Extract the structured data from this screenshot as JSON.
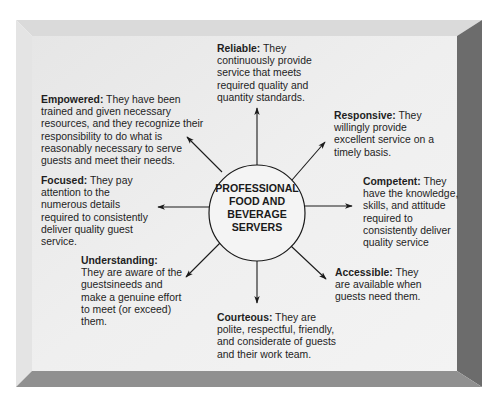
{
  "diagram": {
    "center": {
      "lines": [
        "PROFESSIONAL",
        "FOOD AND",
        "BEVERAGE",
        "SERVERS"
      ]
    },
    "traits": [
      {
        "id": "reliable",
        "title": "Reliable:",
        "body": " They continuously provide service that meets required quality and quantity standards."
      },
      {
        "id": "responsive",
        "title": "Responsive:",
        "body": " They willingly provide excellent service on a timely basis."
      },
      {
        "id": "competent",
        "title": "Competent:",
        "body": " They have the knowledge, skills, and attitude required to consistently deliver quality service"
      },
      {
        "id": "accessible",
        "title": "Accessible:",
        "body": " They are available when guests need them."
      },
      {
        "id": "courteous",
        "title": "Courteous:",
        "body": " They are polite, respectful, friendly, and considerate of guests and their work team."
      },
      {
        "id": "understanding",
        "title": "Understanding:",
        "body": "They are aware of the guestsineeds and make a genuine effort to meet (or exceed) them."
      },
      {
        "id": "focused",
        "title": "Focused:",
        "body": " They pay attention to the numerous details required to consistently deliver quality guest service."
      },
      {
        "id": "empowered",
        "title": "Empowered:",
        "body": " They have been trained and given necessary resources, and they recognize their responsibility to do what is reasonably necessary to serve guests and meet their needs."
      }
    ],
    "colors": {
      "face": "#ececec",
      "top_bevel": "#d9d9d9",
      "left_bevel": "#e3e3e3",
      "right_bevel": "#6e6e6e",
      "bottom_bevel": "#8f8f8f",
      "ink": "#1e1e1e"
    }
  }
}
